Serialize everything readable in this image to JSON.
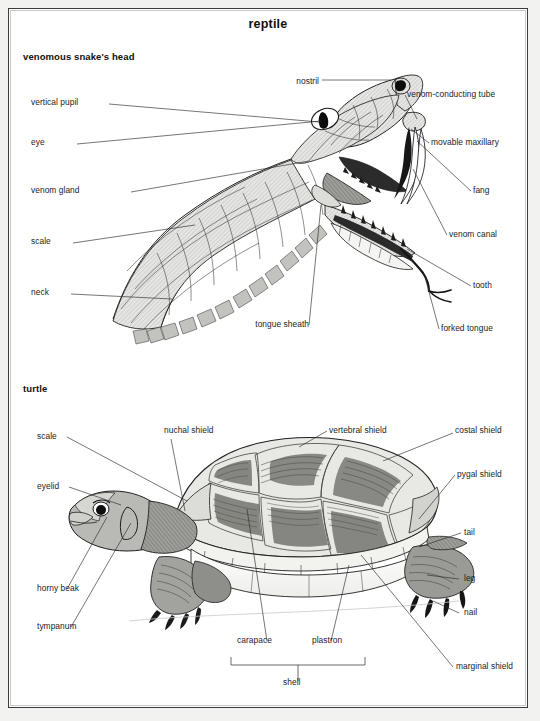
{
  "page": {
    "title": "reptile",
    "sections": [
      {
        "id": "snake",
        "heading": "venomous snake's head"
      },
      {
        "id": "turtle",
        "heading": "turtle"
      }
    ]
  },
  "snake_labels": {
    "nostril": "nostril",
    "vertical_pupil": "vertical pupil",
    "eye": "eye",
    "venom_gland": "venom gland",
    "scale": "scale",
    "neck": "neck",
    "tongue_sheath": "tongue sheath",
    "venom_conducting_tube": "venom-conducting tube",
    "movable_maxillary": "movable maxillary",
    "fang": "fang",
    "venom_canal": "venom canal",
    "tooth": "tooth",
    "forked_tongue": "forked tongue"
  },
  "turtle_labels": {
    "scale": "scale",
    "eyelid": "eyelid",
    "horny_beak": "horny beak",
    "tympanum": "tympanum",
    "nuchal_shield": "nuchal shield",
    "vertebral_shield": "vertebral shield",
    "costal_shield": "costal shield",
    "pygal_shield": "pygal shield",
    "tail": "tail",
    "leg": "leg",
    "nail": "nail",
    "marginal_shield": "marginal shield",
    "carapace": "carapace",
    "plastron": "plastron",
    "shell": "shell"
  },
  "colors": {
    "ink": "#1c1c1c",
    "paper": "#ffffff",
    "frame": "#3b3b3b",
    "scale_fill": "#e4e4e2",
    "shell_dark": "#6f6f6f",
    "shell_mid": "#a8a8a8",
    "shell_light": "#d8d8d4"
  }
}
